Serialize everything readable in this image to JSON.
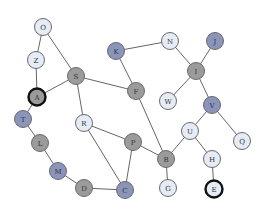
{
  "colors": {
    "light": "#e6ecf5",
    "gray": "#9b9b9b",
    "blue": "#8b94ba"
  },
  "nodes": [
    {
      "id": "O",
      "x": 43,
      "y": 27,
      "fill": "light"
    },
    {
      "id": "Z",
      "x": 36,
      "y": 60,
      "fill": "light"
    },
    {
      "id": "A",
      "x": 37,
      "y": 97,
      "fill": "gray",
      "bold": true
    },
    {
      "id": "S",
      "x": 76,
      "y": 76,
      "fill": "gray"
    },
    {
      "id": "K",
      "x": 116,
      "y": 51,
      "fill": "blue"
    },
    {
      "id": "N",
      "x": 170,
      "y": 41,
      "fill": "light"
    },
    {
      "id": "J",
      "x": 215,
      "y": 41,
      "fill": "blue"
    },
    {
      "id": "I",
      "x": 196,
      "y": 71,
      "fill": "gray"
    },
    {
      "id": "F",
      "x": 136,
      "y": 91,
      "fill": "gray"
    },
    {
      "id": "W",
      "x": 168,
      "y": 101,
      "fill": "light"
    },
    {
      "id": "V",
      "x": 212,
      "y": 105,
      "fill": "blue"
    },
    {
      "id": "T",
      "x": 23,
      "y": 119,
      "fill": "blue"
    },
    {
      "id": "R",
      "x": 84,
      "y": 123,
      "fill": "light"
    },
    {
      "id": "U",
      "x": 190,
      "y": 131,
      "fill": "light"
    },
    {
      "id": "Q",
      "x": 242,
      "y": 141,
      "fill": "light"
    },
    {
      "id": "L",
      "x": 40,
      "y": 143,
      "fill": "gray"
    },
    {
      "id": "P",
      "x": 133,
      "y": 142,
      "fill": "gray"
    },
    {
      "id": "B",
      "x": 166,
      "y": 159,
      "fill": "gray"
    },
    {
      "id": "H",
      "x": 212,
      "y": 159,
      "fill": "light"
    },
    {
      "id": "M",
      "x": 58,
      "y": 171,
      "fill": "blue"
    },
    {
      "id": "D",
      "x": 84,
      "y": 188,
      "fill": "gray"
    },
    {
      "id": "C",
      "x": 125,
      "y": 190,
      "fill": "blue"
    },
    {
      "id": "G",
      "x": 168,
      "y": 188,
      "fill": "light"
    },
    {
      "id": "E",
      "x": 214,
      "y": 189,
      "fill": "light",
      "bold": true
    }
  ],
  "edges": [
    [
      "O",
      "Z"
    ],
    [
      "O",
      "S"
    ],
    [
      "Z",
      "A"
    ],
    [
      "A",
      "S"
    ],
    [
      "A",
      "T"
    ],
    [
      "S",
      "F"
    ],
    [
      "S",
      "R"
    ],
    [
      "K",
      "N"
    ],
    [
      "K",
      "F"
    ],
    [
      "F",
      "B"
    ],
    [
      "N",
      "I"
    ],
    [
      "J",
      "I"
    ],
    [
      "I",
      "W"
    ],
    [
      "I",
      "V"
    ],
    [
      "V",
      "U"
    ],
    [
      "V",
      "Q"
    ],
    [
      "U",
      "B"
    ],
    [
      "U",
      "H"
    ],
    [
      "H",
      "E"
    ],
    [
      "B",
      "G"
    ],
    [
      "P",
      "B"
    ],
    [
      "R",
      "P"
    ],
    [
      "R",
      "C"
    ],
    [
      "P",
      "C"
    ],
    [
      "T",
      "L"
    ],
    [
      "L",
      "M"
    ],
    [
      "M",
      "D"
    ],
    [
      "D",
      "C"
    ]
  ]
}
